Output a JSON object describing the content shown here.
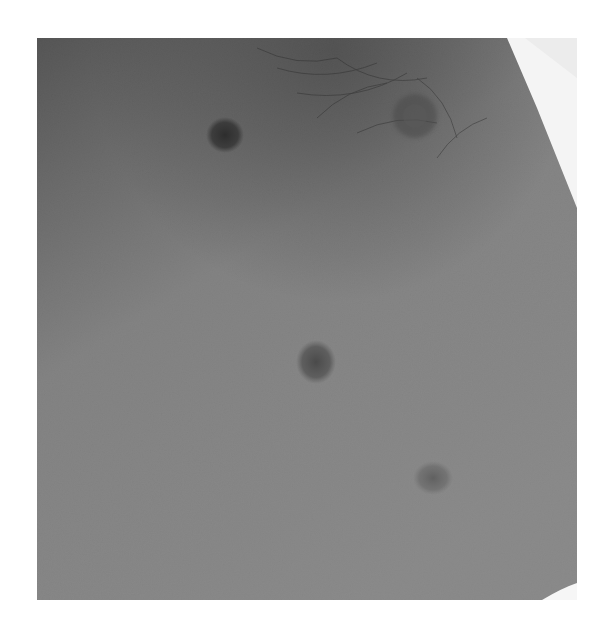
{
  "image": {
    "kind": "grayscale clinical photograph",
    "subject": "skin surface with hair in upper region and multiple dark oval macules",
    "frame": {
      "x": 37,
      "y": 38,
      "width": 540,
      "height": 562
    },
    "background": "#ffffff",
    "tones": {
      "dark_top_left": "#3e3e3e",
      "mid_skin": "#858585",
      "light_lower_right": "#8e8e8e",
      "white_corner": "#f4f4f4"
    },
    "lesions": [
      {
        "label": "upper-left macule",
        "cx": 188,
        "cy": 97,
        "rx": 17,
        "ry": 16,
        "color": "#2e2e2e"
      },
      {
        "label": "center macule",
        "cx": 279,
        "cy": 324,
        "rx": 18,
        "ry": 20,
        "color": "#4a4a4a"
      },
      {
        "label": "lower-right macule",
        "cx": 396,
        "cy": 440,
        "rx": 18,
        "ry": 15,
        "color": "#5e5e5e"
      }
    ],
    "features": [
      {
        "label": "nipple / areola region with hair whorl",
        "cx": 378,
        "cy": 78,
        "r": 22
      },
      {
        "label": "white cloth at top-right corner"
      },
      {
        "label": "white fold at bottom-right corner"
      }
    ]
  }
}
